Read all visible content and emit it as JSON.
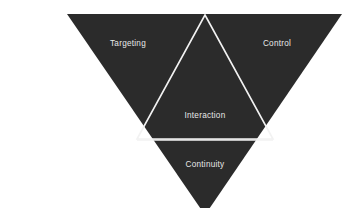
{
  "diagram": {
    "type": "inverted-triangle-framework",
    "title": "",
    "canvas": {
      "width": 355,
      "height": 208
    },
    "colors": {
      "background": "#ffffff",
      "fill": "#2b2b2b",
      "stroke": "#f2f2f2",
      "label_text": "#e8e8e8"
    },
    "geometry": {
      "outer_triangle": {
        "points": "67,14 342,14 205,215",
        "orientation": "inverted",
        "note": "bottom apex clipped by canvas edge"
      },
      "inner_triangle": {
        "points": "205,15 273,139 137,139",
        "orientation": "upright"
      },
      "divider_line": {
        "x1": 137,
        "y1": 140,
        "x2": 273,
        "y2": 140
      },
      "stroke_width": 1.6
    },
    "labels": [
      {
        "id": "targeting",
        "text": "Targeting",
        "x": 128,
        "y": 44
      },
      {
        "id": "control",
        "text": "Control",
        "x": 277,
        "y": 44
      },
      {
        "id": "interaction",
        "text": "Interaction",
        "x": 205,
        "y": 116
      },
      {
        "id": "continuity",
        "text": "Continuity",
        "x": 205,
        "y": 165
      }
    ]
  }
}
